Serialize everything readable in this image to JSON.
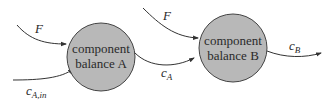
{
  "diagram": {
    "colors": {
      "node_fill": "#b8b8b8",
      "node_stroke": "#444444",
      "edge": "#333333",
      "background": "#ffffff"
    },
    "nodes": [
      {
        "id": "A",
        "line1": "component",
        "line2": "balance A"
      },
      {
        "id": "B",
        "line1": "component",
        "line2": "balance B"
      }
    ],
    "edges": [
      {
        "id": "F-to-A",
        "label": "F",
        "sub": ""
      },
      {
        "id": "cAin-to-A",
        "label": "c",
        "sub": "A,in"
      },
      {
        "id": "F-to-B",
        "label": "F",
        "sub": ""
      },
      {
        "id": "A-to-B",
        "label": "c",
        "sub": "A"
      },
      {
        "id": "B-out",
        "label": "c",
        "sub": "B"
      }
    ]
  }
}
